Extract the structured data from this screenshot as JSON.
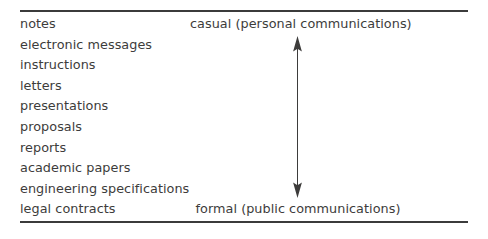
{
  "figure": {
    "background_color": "#ffffff",
    "rule_color": "#3b3b3b",
    "text_color": "#3d3c3b"
  },
  "document_types": {
    "items": [
      {
        "label": "notes"
      },
      {
        "label": "electronic messages"
      },
      {
        "label": "instructions"
      },
      {
        "label": "letters"
      },
      {
        "label": "presentations"
      },
      {
        "label": "proposals"
      },
      {
        "label": "reports"
      },
      {
        "label": "academic papers"
      },
      {
        "label": "engineering specifications"
      },
      {
        "label": "legal contracts"
      }
    ]
  },
  "spectrum": {
    "top_label": "casual (personal communications)",
    "bottom_label": "formal (public communications)",
    "arrow": {
      "icon": "double-headed-vertical-arrow",
      "direction": "up-down",
      "color": "#3d3c3b"
    }
  }
}
